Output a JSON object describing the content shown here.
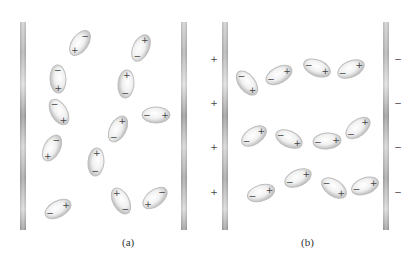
{
  "figure": {
    "panels": [
      {
        "id": "a",
        "caption": "(a)",
        "caption_pos": [
          128,
          244
        ],
        "plates": [
          {
            "side": "left",
            "x": 20,
            "y": 22,
            "w": 6,
            "h": 208
          },
          {
            "side": "right",
            "x": 181,
            "y": 22,
            "w": 6,
            "h": 208
          }
        ],
        "plate_charges": [],
        "molecules": [
          {
            "cx": 80,
            "cy": 43,
            "angle": -55,
            "plus_end": "neg"
          },
          {
            "cx": 141,
            "cy": 48,
            "angle": -65,
            "plus_end": "pos"
          },
          {
            "cx": 58,
            "cy": 79,
            "angle": 88,
            "plus_end": "pos"
          },
          {
            "cx": 126,
            "cy": 84,
            "angle": 95,
            "plus_end": "neg"
          },
          {
            "cx": 59,
            "cy": 112,
            "angle": 60,
            "plus_end": "pos"
          },
          {
            "cx": 156,
            "cy": 115,
            "angle": 0,
            "plus_end": "pos"
          },
          {
            "cx": 118,
            "cy": 129,
            "angle": -62,
            "plus_end": "pos"
          },
          {
            "cx": 52,
            "cy": 148,
            "angle": -62,
            "plus_end": "neg"
          },
          {
            "cx": 96,
            "cy": 162,
            "angle": 95,
            "plus_end": "neg"
          },
          {
            "cx": 58,
            "cy": 209,
            "angle": -28,
            "plus_end": "pos"
          },
          {
            "cx": 121,
            "cy": 201,
            "angle": 62,
            "plus_end": "neg"
          },
          {
            "cx": 155,
            "cy": 198,
            "angle": -38,
            "plus_end": "neg"
          }
        ]
      },
      {
        "id": "b",
        "caption": "(b)",
        "caption_pos": [
          307,
          244
        ],
        "plates": [
          {
            "side": "left",
            "x": 222,
            "y": 22,
            "w": 6,
            "h": 208
          },
          {
            "side": "right",
            "x": 383,
            "y": 22,
            "w": 6,
            "h": 208
          }
        ],
        "plate_charges": [
          {
            "x": 214,
            "y": 59,
            "sign": "+"
          },
          {
            "x": 214,
            "y": 103,
            "sign": "+"
          },
          {
            "x": 214,
            "y": 147,
            "sign": "+"
          },
          {
            "x": 214,
            "y": 192,
            "sign": "+"
          },
          {
            "x": 398,
            "y": 59,
            "sign": "−"
          },
          {
            "x": 398,
            "y": 103,
            "sign": "−"
          },
          {
            "x": 398,
            "y": 147,
            "sign": "−"
          },
          {
            "x": 398,
            "y": 192,
            "sign": "−"
          }
        ],
        "molecules": [
          {
            "cx": 247,
            "cy": 83,
            "angle": 52,
            "plus_end": "pos"
          },
          {
            "cx": 279,
            "cy": 75,
            "angle": -28,
            "plus_end": "pos"
          },
          {
            "cx": 317,
            "cy": 68,
            "angle": 22,
            "plus_end": "pos"
          },
          {
            "cx": 351,
            "cy": 69,
            "angle": -25,
            "plus_end": "pos"
          },
          {
            "cx": 254,
            "cy": 136,
            "angle": -35,
            "plus_end": "pos"
          },
          {
            "cx": 289,
            "cy": 139,
            "angle": 25,
            "plus_end": "pos"
          },
          {
            "cx": 327,
            "cy": 141,
            "angle": -5,
            "plus_end": "pos"
          },
          {
            "cx": 358,
            "cy": 128,
            "angle": -38,
            "plus_end": "pos"
          },
          {
            "cx": 261,
            "cy": 193,
            "angle": -18,
            "plus_end": "pos"
          },
          {
            "cx": 298,
            "cy": 178,
            "angle": -25,
            "plus_end": "pos"
          },
          {
            "cx": 334,
            "cy": 188,
            "angle": 35,
            "plus_end": "pos"
          },
          {
            "cx": 365,
            "cy": 186,
            "angle": -20,
            "plus_end": "pos"
          }
        ]
      }
    ],
    "molecule_size": {
      "rx": 14,
      "ry": 8
    },
    "signs": {
      "plus": "+",
      "minus": "−"
    },
    "colors": {
      "plate_light": "#e2e2e2",
      "plate_dark": "#9a9a9a",
      "molecule_fill_center": "#ffffff",
      "molecule_fill_edge": "#c4c4c4",
      "molecule_stroke": "#bdbdbd",
      "sign_color": "#444444",
      "caption_color": "#333333"
    }
  }
}
